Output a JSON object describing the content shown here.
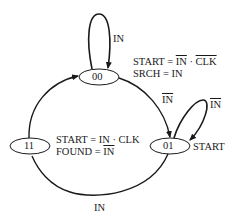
{
  "diagram": {
    "type": "state-machine",
    "stroke_color": "#1a1a1a",
    "states": [
      {
        "id": "00",
        "label": "00"
      },
      {
        "id": "01",
        "label": "01"
      },
      {
        "id": "11",
        "label": "11"
      }
    ],
    "transitions": [
      {
        "from": "00",
        "to": "00",
        "label": "IN",
        "negated": false
      },
      {
        "from": "00",
        "to": "01",
        "label": "IN",
        "negated": true
      },
      {
        "from": "01",
        "to": "01",
        "label": "IN",
        "negated": true
      },
      {
        "from": "01",
        "to": "11",
        "label": "IN",
        "negated": false
      },
      {
        "from": "11",
        "to": "00",
        "label": "",
        "negated": false
      }
    ],
    "outputs": {
      "s00": {
        "line1": {
          "lhs": "START = ",
          "a": "IN",
          "dot": " · ",
          "b": "CLK",
          "a_negated": true,
          "b_negated": true
        },
        "line2": "SRCH = IN"
      },
      "s01": {
        "line1": "START"
      },
      "s11": {
        "line1": "START = IN · CLK",
        "line2": {
          "lhs": "FOUND = ",
          "a": "IN",
          "a_negated": true
        }
      }
    }
  }
}
